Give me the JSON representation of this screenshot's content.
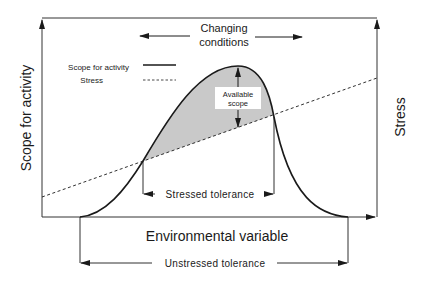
{
  "diagram": {
    "title_arrow_label_line1": "Changing",
    "title_arrow_label_line2": "conditions",
    "y_axis_left_label": "Scope for activity",
    "y_axis_right_label": "Stress",
    "x_axis_label": "Environmental variable",
    "legend": {
      "items": [
        {
          "label": "Scope for activity",
          "style": "solid"
        },
        {
          "label": "Stress",
          "style": "dashed"
        }
      ]
    },
    "shaded_region_label_line1": "Available",
    "shaded_region_label_line2": "scope",
    "stressed_tolerance_label": "Stressed tolerance",
    "unstressed_tolerance_label": "Unstressed tolerance",
    "colors": {
      "line": "#1a1a1a",
      "shade": "#c9c9c9",
      "axis": "#333333"
    }
  }
}
